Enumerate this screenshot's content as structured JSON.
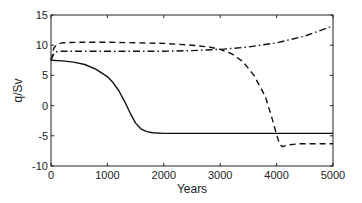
{
  "chart_data": {
    "type": "line",
    "title": "",
    "xlabel": "Years",
    "ylabel": "q/Sv",
    "xlim": [
      0,
      5000
    ],
    "ylim": [
      -10,
      15
    ],
    "xticks": [
      0,
      1000,
      2000,
      3000,
      4000,
      5000
    ],
    "yticks": [
      -10,
      -5,
      0,
      5,
      10,
      15
    ],
    "grid": false,
    "legend": null,
    "series": [
      {
        "name": "solid",
        "style": "solid",
        "x": [
          0,
          200,
          400,
          600,
          800,
          1000,
          1100,
          1200,
          1300,
          1400,
          1500,
          1600,
          1700,
          1800,
          2000,
          3000,
          4000,
          5000
        ],
        "y": [
          7.5,
          7.4,
          7.2,
          6.8,
          6.0,
          4.8,
          3.8,
          2.5,
          0.8,
          -1.2,
          -2.9,
          -3.9,
          -4.3,
          -4.5,
          -4.6,
          -4.6,
          -4.6,
          -4.6
        ]
      },
      {
        "name": "dashed",
        "style": "dashed",
        "x": [
          0,
          50,
          100,
          200,
          500,
          1000,
          1500,
          2000,
          2500,
          2800,
          3000,
          3200,
          3400,
          3600,
          3800,
          3900,
          4000,
          4050,
          4100,
          4200,
          4400,
          5000
        ],
        "y": [
          7.5,
          9.5,
          10.1,
          10.4,
          10.5,
          10.5,
          10.4,
          10.3,
          10.0,
          9.7,
          9.3,
          8.6,
          7.3,
          5.0,
          1.5,
          -1.5,
          -4.8,
          -6.3,
          -6.8,
          -6.5,
          -6.3,
          -6.3
        ]
      },
      {
        "name": "dash-dot",
        "style": "dashdot",
        "x": [
          0,
          50,
          100,
          200,
          500,
          1000,
          2000,
          2500,
          3000,
          3500,
          4000,
          4500,
          5000
        ],
        "y": [
          7.5,
          8.6,
          8.9,
          9.0,
          9.0,
          9.0,
          9.0,
          9.1,
          9.3,
          9.7,
          10.4,
          11.5,
          13.2
        ]
      }
    ]
  },
  "layout": {
    "plot_left": 51,
    "plot_right": 333,
    "plot_top": 15,
    "plot_bottom": 166
  }
}
